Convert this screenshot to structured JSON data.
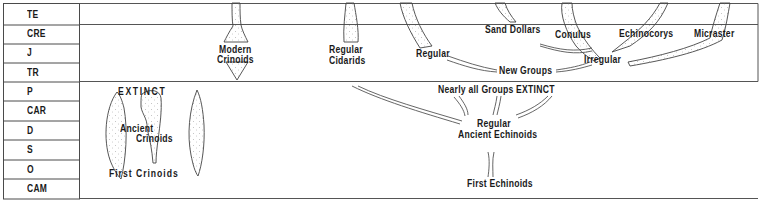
{
  "time_scale": {
    "periods": [
      {
        "code": "TE"
      },
      {
        "code": "CRE"
      },
      {
        "code": "J"
      },
      {
        "code": "TR"
      },
      {
        "code": "P"
      },
      {
        "code": "CAR"
      },
      {
        "code": "D"
      },
      {
        "code": "S"
      },
      {
        "code": "O"
      },
      {
        "code": "CAM"
      }
    ]
  },
  "crinoids": {
    "extinct": "EXTINCT",
    "ancient_1": "Ancient",
    "ancient_2": "Crinoids",
    "first": "First  Crinoids",
    "modern_1": "Modern",
    "modern_2": "Crinoids"
  },
  "echinoids": {
    "regular_cidarids_1": "Regular",
    "regular_cidarids_2": "Cidarids",
    "regular": "Regular",
    "sand_dollars": "Sand Dollars",
    "conulus": "Conulus",
    "echinocorys": "Echinocorys",
    "micraster": "Micraster",
    "irregular": "Irregular",
    "new_groups": "New Groups",
    "nearly_all_extinct": "Nearly  all  Groups EXTINCT",
    "regular_ancient_1": "Regular",
    "regular_ancient_2": "Ancient Echinoids",
    "first": "First Echinoids"
  },
  "colors": {
    "line": "#4a4a4a",
    "text": "#1a1a1a",
    "stipple": "#8a8a8a",
    "background": "#ffffff"
  }
}
